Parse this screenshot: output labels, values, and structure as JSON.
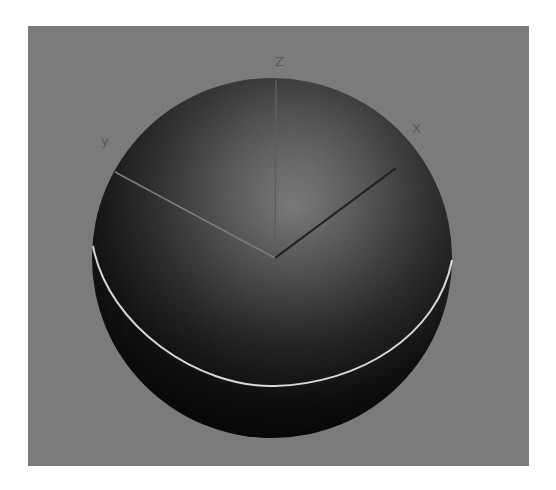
{
  "viewport": {
    "background_color": "#7b7b7b",
    "object": {
      "type": "sphere",
      "center": [
        244,
        232
      ],
      "radius": 180,
      "highlight_center": [
        272,
        184
      ],
      "colors": {
        "highlight": "#8e8e8e",
        "mid": "#3c3c3c",
        "shadow": "#0e0e0e"
      }
    },
    "selection_ring": {
      "color": "#d8d8d8"
    },
    "gizmo": {
      "origin": [
        247,
        232
      ],
      "axes": [
        {
          "name": "x",
          "label": "X",
          "end": [
            368,
            142
          ],
          "color": "#1e1e1e"
        },
        {
          "name": "y",
          "label": "y",
          "end": [
            87,
            146
          ],
          "color": "#8a8a8a"
        },
        {
          "name": "z",
          "label": "Z",
          "end": [
            248,
            54
          ],
          "color": "#6a6a6a"
        }
      ]
    },
    "labels": {
      "x": "X",
      "y": "y",
      "z": "Z"
    }
  }
}
